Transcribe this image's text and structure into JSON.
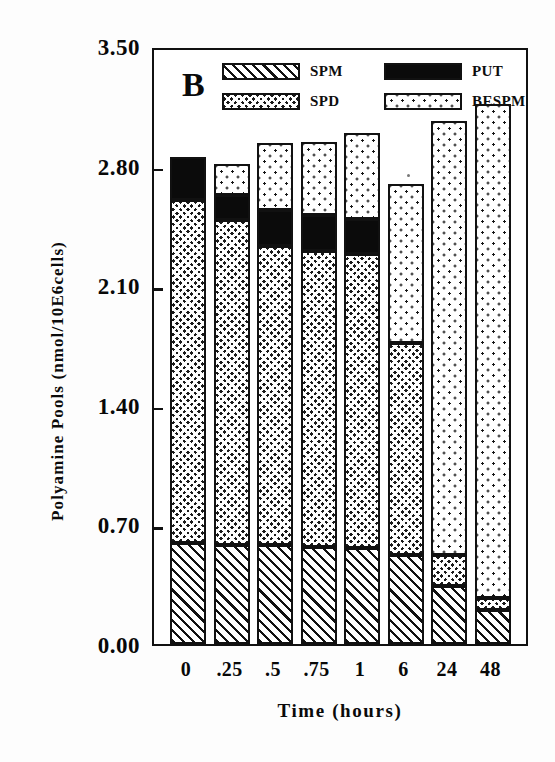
{
  "panel": {
    "letter": "B"
  },
  "axes": {
    "y_title": "Polyamine Pools (nmol/10E6cells)",
    "x_title": "Time (hours)",
    "y_tick_labels": [
      "3.50",
      "2.80",
      "2.10",
      "1.40",
      "0.70",
      "0.00"
    ],
    "x_tick_labels": [
      "0",
      ".25",
      ".5",
      ".75",
      "1",
      "6",
      "24",
      "48"
    ]
  },
  "legend": {
    "entries": [
      {
        "label": "SPM",
        "pattern": "diagonal-hatch",
        "color": "#ffffff"
      },
      {
        "label": "PUT",
        "pattern": "solid-black",
        "color": "#0b0b0b"
      },
      {
        "label": "SPD",
        "pattern": "cross-hatch",
        "color": "#1a1a1a"
      },
      {
        "label": "BESPM",
        "pattern": "stipple-dots",
        "color": "#ffffff"
      }
    ]
  },
  "chart_data": {
    "type": "bar",
    "subtype": "stacked-vertical",
    "title": "B",
    "xlabel": "Time (hours)",
    "ylabel": "Polyamine Pools (nmol/10E6cells)",
    "categories": [
      "0",
      ".25",
      ".5",
      ".75",
      "1",
      "6",
      "24",
      "48"
    ],
    "ylim": [
      0.0,
      3.5
    ],
    "yticks": [
      0.0,
      0.7,
      1.4,
      2.1,
      2.8,
      3.5
    ],
    "grid": false,
    "legend_position": "inside-top-center",
    "stack_order_bottom_to_top": [
      "SPM",
      "SPD",
      "PUT",
      "BESPM"
    ],
    "series": [
      {
        "name": "SPM",
        "values": [
          0.59,
          0.58,
          0.58,
          0.57,
          0.56,
          0.52,
          0.34,
          0.2
        ]
      },
      {
        "name": "SPD",
        "values": [
          2.01,
          1.9,
          1.75,
          1.73,
          1.72,
          1.24,
          0.18,
          0.07
        ]
      },
      {
        "name": "PUT",
        "values": [
          0.25,
          0.15,
          0.21,
          0.21,
          0.21,
          0.0,
          0.0,
          0.0
        ]
      },
      {
        "name": "BESPM",
        "values": [
          0.0,
          0.18,
          0.39,
          0.43,
          0.5,
          0.93,
          2.54,
          2.89
        ]
      }
    ],
    "totals": [
      2.85,
      2.81,
      2.93,
      2.94,
      2.99,
      2.69,
      3.06,
      3.16
    ]
  }
}
